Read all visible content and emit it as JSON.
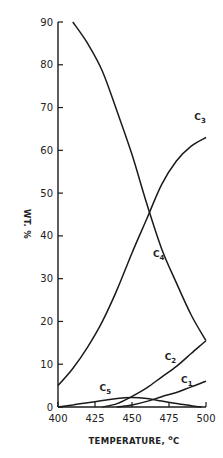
{
  "chart_data": {
    "type": "line",
    "title": "",
    "xlabel": "TEMPERATURE, °C",
    "xlabel_parts": {
      "text": "TEMPERATURE, ",
      "unit_sup": "o",
      "unit": "C"
    },
    "ylabel": "WT. %",
    "xlim": [
      400,
      500
    ],
    "ylim": [
      0,
      90
    ],
    "xticks": [
      400,
      425,
      450,
      475,
      500
    ],
    "yticks": [
      0,
      10,
      20,
      30,
      40,
      50,
      60,
      70,
      80,
      90
    ],
    "grid": false,
    "legend": "inline labels",
    "series": [
      {
        "name": "C1",
        "label_main": "C",
        "label_sub": "1",
        "x": [
          440,
          450,
          460,
          470,
          480,
          490,
          500
        ],
        "y": [
          0,
          0.5,
          1.3,
          2.4,
          3.4,
          4.7,
          6
        ]
      },
      {
        "name": "C2",
        "label_main": "C",
        "label_sub": "2",
        "x": [
          430,
          440,
          450,
          460,
          470,
          480,
          490,
          500
        ],
        "y": [
          0,
          0.8,
          2.5,
          4.5,
          7,
          9.5,
          12.5,
          15.5
        ]
      },
      {
        "name": "C3",
        "label_main": "C",
        "label_sub": "3",
        "x": [
          400,
          410,
          420,
          430,
          440,
          450,
          460,
          470,
          480,
          490,
          500
        ],
        "y": [
          5,
          9,
          14,
          20,
          27.5,
          36,
          44,
          52,
          57.5,
          61,
          63
        ]
      },
      {
        "name": "C4",
        "label_main": "C",
        "label_sub": "4",
        "x": [
          410,
          420,
          430,
          440,
          450,
          460,
          470,
          480,
          490,
          500
        ],
        "y": [
          90,
          85,
          78.5,
          69,
          59,
          47.5,
          37,
          29,
          21.5,
          15.5
        ]
      },
      {
        "name": "C5",
        "label_main": "C",
        "label_sub": "5",
        "x": [
          400,
          410,
          420,
          430,
          440,
          450,
          460,
          470,
          480,
          490,
          497
        ],
        "y": [
          0,
          0.5,
          1,
          1.5,
          2,
          2.2,
          2,
          1.4,
          0.8,
          0.3,
          0
        ]
      }
    ],
    "annotations": [
      {
        "text": "C3",
        "x": 496,
        "y": 67
      },
      {
        "text": "C4",
        "x": 468,
        "y": 35
      },
      {
        "text": "C2",
        "x": 476,
        "y": 11
      },
      {
        "text": "C1",
        "x": 487,
        "y": 5.5
      },
      {
        "text": "C5",
        "x": 432,
        "y": 3.7
      }
    ]
  }
}
